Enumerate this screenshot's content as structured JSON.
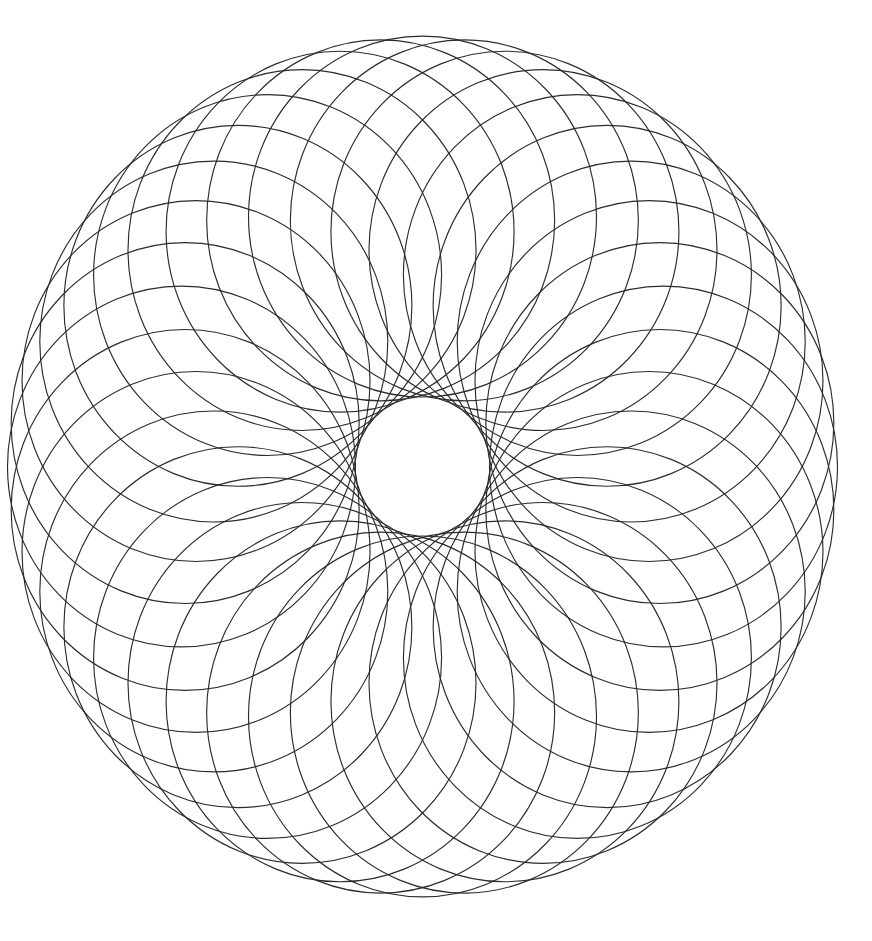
{
  "figure": {
    "description": "Spirograph rosette of overlapping circles arranged around a central empty circle",
    "background_color": "#ffffff",
    "stroke_color": "#2b2b2b",
    "center": {
      "x": 422.5,
      "y": 466.5
    },
    "circle_count": 36,
    "angle_step_deg": 10,
    "circle_radius_x": 174,
    "center_distance_x": 241,
    "vertical_scale": 1.037,
    "inner_hole_radius": 67,
    "outer_envelope_radius": 415
  }
}
